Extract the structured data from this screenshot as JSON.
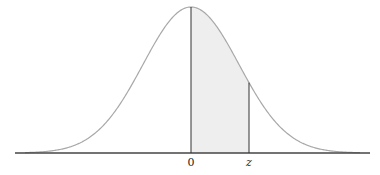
{
  "diagram": {
    "type": "standard normal curve with shaded area",
    "labels": {
      "mean": "0",
      "z": "z"
    },
    "colors": {
      "curve": "#a8a8a8",
      "shade": "#eeeeee",
      "lines": "#333333",
      "axis": "#444444"
    },
    "geometry": {
      "axis_y": 153,
      "axis_x1": 15,
      "axis_x2": 370,
      "center_x": 191,
      "peak_height": 146,
      "sigma_px": 48,
      "z_x": 249
    }
  }
}
